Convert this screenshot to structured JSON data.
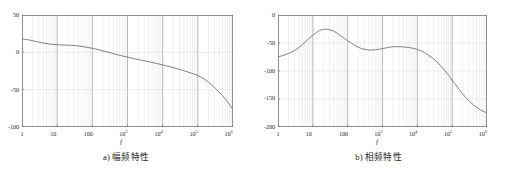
{
  "figure": {
    "background_color": "#ffffff",
    "axis_color": "#6e6e6e",
    "grid_major_color": "#9a9a9a",
    "grid_minor_color": "#d8d8d8",
    "curve_color": "#6b6b6b"
  },
  "panels": [
    {
      "id": "panel-a",
      "caption": "a) 幅频特性",
      "xlabel": "f",
      "chart_data": {
        "type": "line",
        "title": "a) 幅频特性",
        "xlabel": "f",
        "ylabel": "",
        "xscale": "log",
        "xlim": [
          1,
          1000000
        ],
        "ylim": [
          -100,
          50
        ],
        "yticks": [
          50,
          0,
          -50,
          -100
        ],
        "ytick_labels": [
          "50",
          "0",
          "-50",
          "-100"
        ],
        "xticks": [
          1,
          10,
          100,
          1000,
          10000,
          100000,
          1000000
        ],
        "xtick_labels": [
          "1",
          "10",
          "100",
          "10^3",
          "10^4",
          "10^5",
          "10^6"
        ],
        "grid": true,
        "legend": "none",
        "series": [
          {
            "name": "amplitude",
            "x": [
              1,
              1.6,
              2.5,
              4,
              6.3,
              10,
              16,
              25,
              40,
              63,
              100,
              160,
              250,
              400,
              630,
              1000,
              1600,
              2500,
              4000,
              6300,
              10000,
              16000,
              25000,
              40000,
              63000,
              100000,
              160000,
              250000,
              400000,
              630000,
              1000000
            ],
            "y": [
              18,
              16.5,
              14.5,
              12.5,
              11,
              10.2,
              9.8,
              9.4,
              8.6,
              7.2,
              5.4,
              3.2,
              0.8,
              -1.8,
              -4.2,
              -6.5,
              -8.6,
              -10.6,
              -12.6,
              -14.6,
              -16.8,
              -19.2,
              -21.8,
              -24.6,
              -27.6,
              -31.0,
              -36.5,
              -44.0,
              -53.0,
              -63.5,
              -77.0
            ]
          }
        ]
      }
    },
    {
      "id": "panel-b",
      "caption": "b) 相频特性",
      "xlabel": "f",
      "chart_data": {
        "type": "line",
        "title": "b) 相频特性",
        "xlabel": "f",
        "ylabel": "",
        "xscale": "log",
        "xlim": [
          1,
          1000000
        ],
        "ylim": [
          -200,
          0
        ],
        "yticks": [
          0,
          -50,
          -100,
          -150,
          -200
        ],
        "ytick_labels": [
          "0",
          "-50",
          "-100",
          "-150",
          "-200"
        ],
        "xticks": [
          1,
          10,
          100,
          1000,
          10000,
          100000,
          1000000
        ],
        "xtick_labels": [
          "1",
          "10",
          "100",
          "10^3",
          "10^4",
          "10^5",
          "10^6"
        ],
        "grid": true,
        "legend": "none",
        "series": [
          {
            "name": "phase",
            "x": [
              1,
              1.6,
              2.5,
              4,
              6.3,
              10,
              16,
              25,
              40,
              63,
              100,
              160,
              250,
              400,
              630,
              1000,
              1600,
              2500,
              4000,
              6300,
              10000,
              16000,
              25000,
              40000,
              63000,
              100000,
              160000,
              250000,
              400000,
              630000,
              1000000
            ],
            "y": [
              -75,
              -71,
              -66,
              -58,
              -47,
              -36,
              -27.5,
              -25.5,
              -29,
              -37,
              -46,
              -54,
              -60,
              -62.5,
              -62,
              -60,
              -57.5,
              -56.5,
              -57,
              -58.5,
              -61.5,
              -67,
              -75,
              -86,
              -100,
              -116,
              -133,
              -148,
              -160,
              -169,
              -175
            ]
          }
        ]
      }
    }
  ]
}
